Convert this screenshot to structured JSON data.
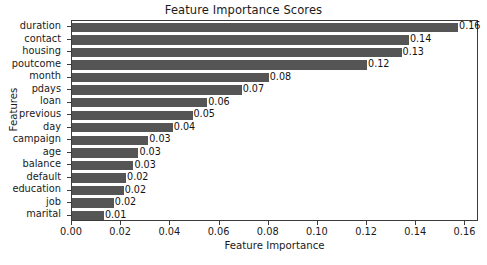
{
  "chart_data": {
    "type": "bar",
    "orientation": "horizontal",
    "title": "Feature Importance Scores",
    "xlabel": "Feature Importance",
    "ylabel": "Features",
    "xlim": [
      0.0,
      0.1655
    ],
    "xticks": [
      "0.00",
      "0.02",
      "0.04",
      "0.06",
      "0.08",
      "0.10",
      "0.12",
      "0.14",
      "0.16"
    ],
    "xtick_values": [
      0.0,
      0.02,
      0.04,
      0.06,
      0.08,
      0.1,
      0.12,
      0.14,
      0.16
    ],
    "grid": false,
    "legend": null,
    "bar_color": "#555555",
    "categories": [
      "duration",
      "contact",
      "housing",
      "poutcome",
      "month",
      "pdays",
      "loan",
      "previous",
      "day",
      "campaign",
      "age",
      "balance",
      "default",
      "education",
      "job",
      "marital"
    ],
    "values": [
      0.157,
      0.137,
      0.134,
      0.12,
      0.08,
      0.069,
      0.055,
      0.049,
      0.041,
      0.031,
      0.027,
      0.025,
      0.022,
      0.021,
      0.017,
      0.013
    ],
    "labels": [
      "0.16",
      "0.14",
      "0.13",
      "0.12",
      "0.08",
      "0.07",
      "0.06",
      "0.05",
      "0.04",
      "0.03",
      "0.03",
      "0.03",
      "0.02",
      "0.02",
      "0.02",
      "0.01"
    ],
    "bars": [
      {
        "category": "duration",
        "value": 0.157,
        "label": "0.16"
      },
      {
        "category": "contact",
        "value": 0.137,
        "label": "0.14"
      },
      {
        "category": "housing",
        "value": 0.134,
        "label": "0.13"
      },
      {
        "category": "poutcome",
        "value": 0.12,
        "label": "0.12"
      },
      {
        "category": "month",
        "value": 0.08,
        "label": "0.08"
      },
      {
        "category": "pdays",
        "value": 0.069,
        "label": "0.07"
      },
      {
        "category": "loan",
        "value": 0.055,
        "label": "0.06"
      },
      {
        "category": "previous",
        "value": 0.049,
        "label": "0.05"
      },
      {
        "category": "day",
        "value": 0.041,
        "label": "0.04"
      },
      {
        "category": "campaign",
        "value": 0.031,
        "label": "0.03"
      },
      {
        "category": "age",
        "value": 0.027,
        "label": "0.03"
      },
      {
        "category": "balance",
        "value": 0.025,
        "label": "0.03"
      },
      {
        "category": "default",
        "value": 0.022,
        "label": "0.02"
      },
      {
        "category": "education",
        "value": 0.021,
        "label": "0.02"
      },
      {
        "category": "job",
        "value": 0.017,
        "label": "0.02"
      },
      {
        "category": "marital",
        "value": 0.013,
        "label": "0.01"
      }
    ]
  }
}
